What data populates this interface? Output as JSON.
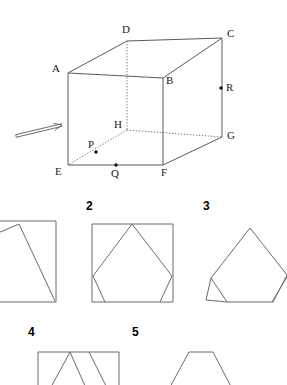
{
  "figure": {
    "cube": {
      "name": "labelled-cube",
      "vertices": [
        {
          "id": "A",
          "label": "A",
          "x": 68,
          "y": 73,
          "label_x": 52,
          "label_y": 72
        },
        {
          "id": "B",
          "label": "B",
          "x": 163,
          "y": 78,
          "label_x": 166,
          "label_y": 84
        },
        {
          "id": "C",
          "label": "C",
          "x": 222,
          "y": 38,
          "label_x": 227,
          "label_y": 37
        },
        {
          "id": "D",
          "label": "D",
          "x": 127,
          "y": 41,
          "label_x": 122,
          "label_y": 33
        },
        {
          "id": "E",
          "label": "E",
          "x": 68,
          "y": 165,
          "label_x": 55,
          "label_y": 175
        },
        {
          "id": "F",
          "label": "F",
          "x": 163,
          "y": 165,
          "label_x": 161,
          "label_y": 176
        },
        {
          "id": "G",
          "label": "G",
          "x": 222,
          "y": 137,
          "label_x": 227,
          "label_y": 139
        },
        {
          "id": "H",
          "label": "H",
          "x": 127,
          "y": 130,
          "label_x": 114,
          "label_y": 128
        }
      ],
      "solid_edges": [
        [
          "A",
          "B"
        ],
        [
          "B",
          "C"
        ],
        [
          "A",
          "D"
        ],
        [
          "D",
          "C"
        ],
        [
          "A",
          "E"
        ],
        [
          "B",
          "F"
        ],
        [
          "C",
          "G"
        ],
        [
          "E",
          "F"
        ],
        [
          "F",
          "G"
        ]
      ],
      "hidden_edges": [
        [
          "D",
          "H"
        ],
        [
          "H",
          "G"
        ],
        [
          "H",
          "E"
        ]
      ],
      "marked_points": [
        {
          "id": "P",
          "label": "P",
          "x": 96,
          "y": 152,
          "label_x": 88,
          "label_y": 148,
          "on_edge": "E-H"
        },
        {
          "id": "Q",
          "label": "Q",
          "x": 116,
          "y": 165,
          "label_x": 111,
          "label_y": 177,
          "on_edge": "E-F"
        },
        {
          "id": "R",
          "label": "R",
          "x": 221,
          "y": 88,
          "label_x": 226,
          "label_y": 91,
          "on_edge": "C-G"
        }
      ],
      "direction_arrow": {
        "name": "view-direction-arrow",
        "from_x": 16,
        "from_y": 136,
        "to_x": 62,
        "to_y": 125
      }
    },
    "options": [
      {
        "number": "1",
        "name": "option-1-shape",
        "label_x": -14,
        "label_y": 210,
        "description": "square-with-triangle"
      },
      {
        "number": "2",
        "name": "option-2-shape",
        "label_x": 86,
        "label_y": 210,
        "description": "square-with-inscribed-rotated-square"
      },
      {
        "number": "3",
        "name": "option-3-shape",
        "label_x": 203,
        "label_y": 210,
        "description": "kite-pentagon-with-corner-triangles"
      },
      {
        "number": "4",
        "name": "option-4-shape",
        "label_x": 28,
        "label_y": 336,
        "description": "rectangle-with-zigzag-lines"
      },
      {
        "number": "5",
        "name": "option-5-shape",
        "label_x": 132,
        "label_y": 336,
        "description": "trapezoid"
      }
    ]
  }
}
